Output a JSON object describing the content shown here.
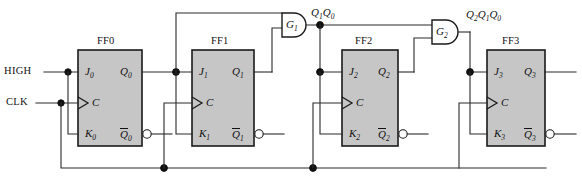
{
  "figure": {
    "name": "synchronous-counter-circuit",
    "type": "logic-diagram"
  },
  "inputs": [
    {
      "id": "high",
      "label": "HIGH"
    },
    {
      "id": "clk",
      "label": "CLK"
    }
  ],
  "flipflops": [
    {
      "id": "ff0",
      "title": "FF0",
      "pins": {
        "j": "J",
        "j_sub": "0",
        "c": "C",
        "k": "K",
        "k_sub": "0",
        "q": "Q",
        "q_sub": "0",
        "qbar": "Q",
        "qbar_sub": "0"
      }
    },
    {
      "id": "ff1",
      "title": "FF1",
      "pins": {
        "j": "J",
        "j_sub": "1",
        "c": "C",
        "k": "K",
        "k_sub": "1",
        "q": "Q",
        "q_sub": "1",
        "qbar": "Q",
        "qbar_sub": "1"
      }
    },
    {
      "id": "ff2",
      "title": "FF2",
      "pins": {
        "j": "J",
        "j_sub": "2",
        "c": "C",
        "k": "K",
        "k_sub": "2",
        "q": "Q",
        "q_sub": "2",
        "qbar": "Q",
        "qbar_sub": "2"
      }
    },
    {
      "id": "ff3",
      "title": "FF3",
      "pins": {
        "j": "J",
        "j_sub": "3",
        "c": "C",
        "k": "K",
        "k_sub": "3",
        "q": "Q",
        "q_sub": "3",
        "qbar": "Q",
        "qbar_sub": "3"
      }
    }
  ],
  "gates": [
    {
      "id": "g1",
      "label": "G",
      "label_sub": "1",
      "type": "AND",
      "output_label_parts": [
        {
          "base": "Q",
          "sub": "1"
        },
        {
          "base": "Q",
          "sub": "0"
        }
      ]
    },
    {
      "id": "g2",
      "label": "G",
      "label_sub": "2",
      "type": "AND",
      "output_label_parts": [
        {
          "base": "Q",
          "sub": "2"
        },
        {
          "base": "Q",
          "sub": "1"
        },
        {
          "base": "Q",
          "sub": "0"
        }
      ]
    }
  ],
  "labels": {
    "high": "HIGH",
    "clk": "CLK",
    "ff0": "FF0",
    "ff1": "FF1",
    "ff2": "FF2",
    "ff3": "FF3",
    "g1": "G",
    "g1_sub": "1",
    "g2": "G",
    "g2_sub": "2",
    "j0": "J",
    "j0s": "0",
    "k0": "K",
    "k0s": "0",
    "q0": "Q",
    "q0s": "0",
    "qb0": "Q",
    "qb0s": "0",
    "j1": "J",
    "j1s": "1",
    "k1": "K",
    "k1s": "1",
    "q1": "Q",
    "q1s": "1",
    "qb1": "Q",
    "qb1s": "1",
    "j2": "J",
    "j2s": "2",
    "k2": "K",
    "k2s": "2",
    "q2": "Q",
    "q2s": "2",
    "qb2": "Q",
    "qb2s": "2",
    "j3": "J",
    "j3s": "3",
    "k3": "K",
    "k3s": "3",
    "q3": "Q",
    "q3s": "3",
    "qb3": "Q",
    "qb3s": "3",
    "c": "C",
    "g1out_a": "Q",
    "g1out_as": "1",
    "g1out_b": "Q",
    "g1out_bs": "0",
    "g2out_a": "Q",
    "g2out_as": "2",
    "g2out_b": "Q",
    "g2out_bs": "1",
    "g2out_c": "Q",
    "g2out_cs": "0"
  },
  "colors": {
    "wire": "#2b2b2b",
    "box_fill": "#c6c6c6",
    "box_stroke": "#1a1a1a",
    "text": "#111111",
    "background": "#ffffff"
  }
}
